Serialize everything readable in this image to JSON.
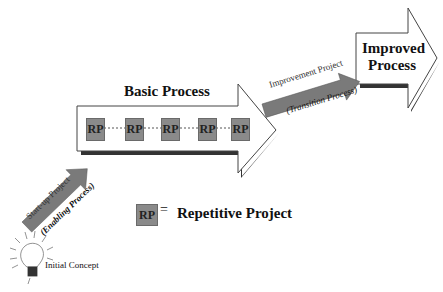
{
  "basic_process": {
    "title": "Basic Process",
    "items": [
      "RP",
      "RP",
      "RP",
      "RP",
      "RP"
    ]
  },
  "improved_process": {
    "line1": "Improved",
    "line2": "Process"
  },
  "improvement_project": {
    "label": "Improvement Project",
    "sub": "(Transition Process)"
  },
  "startup_project": {
    "label": "Start-up Project",
    "sub": "(Enabling Process)"
  },
  "initial_concept": {
    "label": "Initial Concept"
  },
  "legend": {
    "symbol": "RP",
    "equals": "=",
    "text": "Repetitive Project"
  },
  "colors": {
    "arrow_fill": "#7a7a7a",
    "rp_fill": "#8a8a8a",
    "shadow": "#333333"
  }
}
